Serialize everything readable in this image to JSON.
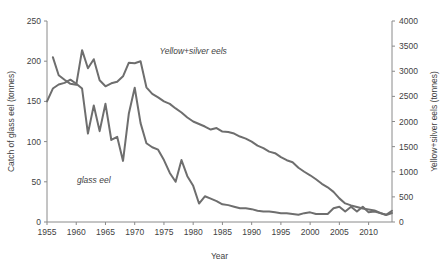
{
  "chart_data": {
    "type": "line",
    "title": "",
    "xlabel": "Year",
    "ylabel": "Catch of glass eel (tonnes)",
    "ylabel_right": "Yellow+silver eels (tonnes)",
    "xlim": [
      1955,
      2014
    ],
    "ylim": [
      0,
      250
    ],
    "ylim_right": [
      0,
      4000
    ],
    "grid": false,
    "legend_position": "inline-annotations",
    "xticks": [
      1955,
      1960,
      1965,
      1970,
      1975,
      1980,
      1985,
      1990,
      1995,
      2000,
      2005,
      2010
    ],
    "yticks_left": [
      0,
      50,
      100,
      150,
      200,
      250
    ],
    "yticks_right": [
      0,
      500,
      1000,
      1500,
      2000,
      2500,
      3000,
      3500,
      4000
    ],
    "annotations": [
      {
        "text": "Yellow+silver eels",
        "x": 1980,
        "y_right": 3350
      },
      {
        "text": "glass eel",
        "x": 1963,
        "y_left": 48
      }
    ],
    "x": [
      1955,
      1956,
      1957,
      1958,
      1959,
      1960,
      1961,
      1962,
      1963,
      1964,
      1965,
      1966,
      1967,
      1968,
      1969,
      1970,
      1971,
      1972,
      1973,
      1974,
      1975,
      1976,
      1977,
      1978,
      1979,
      1980,
      1981,
      1982,
      1983,
      1984,
      1985,
      1986,
      1987,
      1988,
      1989,
      1990,
      1991,
      1992,
      1993,
      1994,
      1995,
      1996,
      1997,
      1998,
      1999,
      2000,
      2001,
      2002,
      2003,
      2004,
      2005,
      2006,
      2007,
      2008,
      2009,
      2010,
      2011,
      2012,
      2013,
      2014
    ],
    "series": [
      {
        "name": "glass eel",
        "axis": "left",
        "units": "tonnes",
        "values": [
          150,
          166,
          171,
          173,
          177,
          172,
          166,
          110,
          145,
          113,
          147,
          102,
          106,
          76,
          135,
          167,
          123,
          98,
          93,
          90,
          77,
          61,
          50,
          77,
          57,
          45,
          23,
          32,
          29,
          26,
          22,
          21,
          19,
          17,
          17,
          16,
          14,
          13,
          13,
          12,
          11,
          11,
          10,
          9,
          11,
          12,
          10,
          10,
          10,
          17,
          19,
          13,
          19,
          13,
          19,
          12,
          13,
          11,
          9,
          14
        ]
      },
      {
        "name": "Yellow+silver eels",
        "axis": "right",
        "units": "tonnes",
        "values": [
          null,
          3280,
          2920,
          2830,
          2750,
          2730,
          3420,
          3060,
          3240,
          2820,
          2700,
          2760,
          2790,
          2900,
          3170,
          3160,
          3200,
          2680,
          2550,
          2480,
          2400,
          2350,
          2260,
          2180,
          2080,
          2000,
          1950,
          1900,
          1840,
          1870,
          1800,
          1790,
          1760,
          1700,
          1660,
          1600,
          1520,
          1470,
          1400,
          1370,
          1290,
          1230,
          1190,
          1080,
          1000,
          930,
          850,
          760,
          690,
          600,
          470,
          370,
          330,
          300,
          270,
          250,
          230,
          180,
          140,
          180
        ]
      }
    ]
  },
  "axes": {
    "x_title": "Year",
    "y_left_title": "Catch of glass eel (tonnes)",
    "y_right_title": "Yellow+silver eels (tonnes)"
  },
  "colors": {
    "line": "#6e6e6e",
    "axis": "#8a8a8a",
    "text": "#3f3f3f",
    "background": "#ffffff"
  }
}
